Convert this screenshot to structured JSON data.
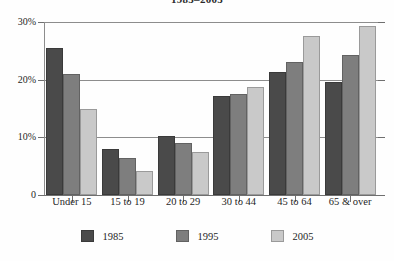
{
  "chart_data": {
    "type": "bar",
    "title": "1985–2005",
    "xlabel": "",
    "ylabel": "",
    "categories": [
      "Under 15",
      "15 to 19",
      "20 to 29",
      "30 to 44",
      "45 to 64",
      "65 & over"
    ],
    "series": [
      {
        "name": "1985",
        "color": "#4a4a4a",
        "values": [
          25.5,
          8.0,
          10.2,
          17.1,
          21.4,
          19.6
        ]
      },
      {
        "name": "1995",
        "color": "#7e7e7e",
        "values": [
          21.0,
          6.4,
          9.1,
          17.6,
          23.0,
          24.2
        ]
      },
      {
        "name": "2005",
        "color": "#c9c9c9",
        "values": [
          15.0,
          4.1,
          7.4,
          18.7,
          27.5,
          29.3
        ]
      }
    ],
    "ylim": [
      0,
      30
    ],
    "yticks": [
      0,
      10,
      20,
      30
    ],
    "ytick_labels": [
      "0",
      "10%",
      "20%",
      "30%"
    ],
    "grid": true,
    "legend_position": "bottom"
  }
}
